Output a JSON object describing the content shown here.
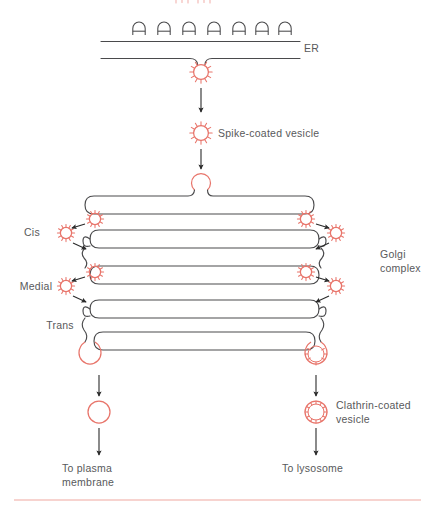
{
  "figure": {
    "type": "biological-pathway-diagram",
    "background_color": "#ffffff",
    "membrane_color": "#4a4a4c",
    "vesicle_color": "#e8756b",
    "label_color": "#58595b",
    "arrow_color": "#2b2b2b",
    "bottom_rule_color": "#f0a79f"
  },
  "labels": {
    "er": "ER",
    "spike_coated_vesicle": "Spike-coated vesicle",
    "cis": "Cis",
    "medial": "Medial",
    "trans": "Trans",
    "golgi_line1": "Golgi",
    "golgi_line2": "complex",
    "clathrin_line1": "Clathrin-coated",
    "clathrin_line2": "vesicle",
    "to_plasma_line1": "To plasma",
    "to_plasma_line2": "membrane",
    "to_lysosome": "To lysosome"
  },
  "structures": {
    "er": {
      "name": "rough endoplasmic reticulum",
      "ribosome_count": 7,
      "membrane_count": 2,
      "budding_vesicle": "spike-coated"
    },
    "golgi": {
      "name": "Golgi complex",
      "cisternae": [
        "Cis",
        "Medial",
        "Trans"
      ],
      "cisterna_count": 4,
      "shuttle_vesicles_per_side": 2
    },
    "output": {
      "left_branch": {
        "vesicle_type": "uncoated transport vesicle",
        "destination": "To plasma membrane"
      },
      "right_branch": {
        "vesicle_type": "Clathrin-coated vesicle",
        "destination": "To lysosome"
      }
    }
  }
}
